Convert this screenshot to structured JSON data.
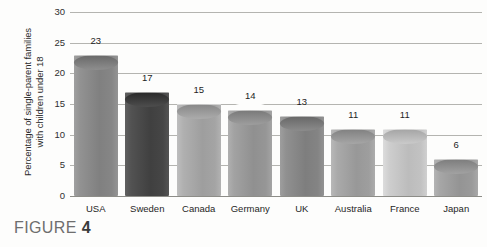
{
  "figure": {
    "caption_prefix": "FIGURE",
    "caption_number": "4"
  },
  "chart_data": {
    "type": "bar",
    "title": "",
    "xlabel": "",
    "ylabel": "Percentage of single-parent families with children under 18",
    "ylabel_line1": "Percentage of single-parent families",
    "ylabel_line2": "with children under 18",
    "ylim": [
      0,
      30
    ],
    "yticks": [
      0,
      5,
      10,
      15,
      20,
      25,
      30
    ],
    "ytick_labels": [
      "0",
      "5",
      "10",
      "15",
      "20",
      "25",
      "30"
    ],
    "grid": true,
    "legend": false,
    "categories": [
      "USA",
      "Sweden",
      "Canada",
      "Germany",
      "UK",
      "Australia",
      "France",
      "Japan"
    ],
    "values": [
      23,
      17,
      15,
      14,
      13,
      11,
      11,
      6
    ],
    "value_labels": [
      "23",
      "17",
      "15",
      "14",
      "13",
      "11",
      "11",
      "6"
    ],
    "bar_colors": [
      "#8a8a8a",
      "#4a4a4a",
      "#a8a8a8",
      "#9a9a9a",
      "#888888",
      "#a2a2a2",
      "#c6c6c6",
      "#9e9e9e"
    ],
    "bar_style": "3d-cylinder"
  },
  "colors": {
    "gridline": "#b4b4b0",
    "axis": "#8d8d88",
    "text": "#1f1f1f",
    "caption": "#6e6e6e",
    "background": "#fdfdfc"
  }
}
